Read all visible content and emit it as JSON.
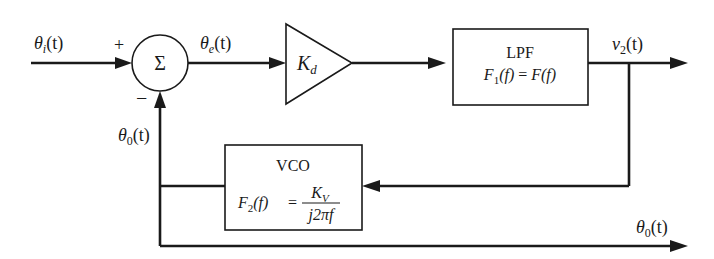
{
  "diagram": {
    "type": "block-diagram",
    "signals": {
      "input": {
        "symbol": "θ",
        "subscript": "i",
        "arg": "(t)"
      },
      "error": {
        "symbol": "θ",
        "subscript": "e",
        "arg": "(t)"
      },
      "output_v2": {
        "symbol": "v",
        "subscript": "2",
        "arg": "(t)"
      },
      "feedback": {
        "symbol": "θ",
        "subscript": "0",
        "arg": "(t)"
      },
      "output_theta0": {
        "symbol": "θ",
        "subscript": "0",
        "arg": "(t)"
      }
    },
    "summer": {
      "symbol": "Σ",
      "plus_sign": "+",
      "minus_sign": "−"
    },
    "gain": {
      "symbol": "K",
      "subscript": "d"
    },
    "lpf": {
      "title": "LPF",
      "equation": {
        "lhs_func": "F",
        "lhs_sub": "1",
        "lhs_arg": "(f)",
        "equals": " = ",
        "rhs": "F(f)"
      }
    },
    "vco": {
      "title": "VCO",
      "equation": {
        "lhs_func": "F",
        "lhs_sub": "2",
        "lhs_arg": "(f)",
        "equals": "=",
        "numerator": "K",
        "numerator_sub": "V",
        "denominator": "j2πf"
      }
    }
  }
}
